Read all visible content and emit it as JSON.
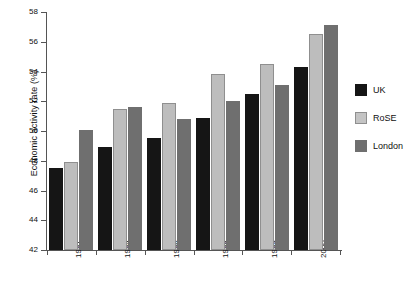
{
  "chart_data": {
    "type": "bar",
    "title": "",
    "xlabel": "",
    "ylabel": "Economic activity rate (%)",
    "ylim": [
      42,
      58
    ],
    "yticks": [
      42,
      44,
      46,
      48,
      50,
      52,
      54,
      56,
      58
    ],
    "grid": false,
    "legend_position": "right",
    "categories": [
      "1981",
      "1984",
      "1986",
      "1988",
      "1989",
      "2000"
    ],
    "series": [
      {
        "name": "UK",
        "color": "#151515",
        "values": [
          47.5,
          48.9,
          49.5,
          50.9,
          52.5,
          54.3
        ]
      },
      {
        "name": "RoSE",
        "color": "#bdbdbd",
        "values": [
          47.9,
          51.5,
          51.9,
          53.8,
          54.5,
          56.5
        ]
      },
      {
        "name": "London",
        "color": "#6f6f6f",
        "values": [
          50.1,
          51.6,
          50.8,
          52.0,
          53.1,
          57.1
        ]
      }
    ]
  },
  "legend": {
    "items": [
      {
        "label": "UK"
      },
      {
        "label": "RoSE"
      },
      {
        "label": "London"
      }
    ]
  },
  "axes": {
    "y_title": "Economic activity rate (%)"
  }
}
